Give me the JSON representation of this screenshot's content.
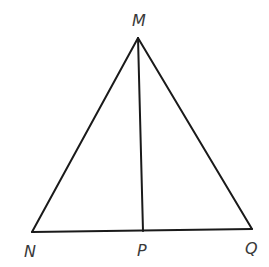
{
  "figure": {
    "type": "triangle with segment",
    "points": {
      "M": {
        "label": "M",
        "x": 138,
        "y": 38
      },
      "N": {
        "label": "N",
        "x": 32,
        "y": 232
      },
      "P": {
        "label": "P",
        "x": 143,
        "y": 231
      },
      "Q": {
        "label": "Q",
        "x": 252,
        "y": 229
      }
    },
    "segments": [
      "MN",
      "MQ",
      "NQ",
      "MP"
    ],
    "labels": {
      "M": "M",
      "N": "N",
      "P": "P",
      "Q": "Q"
    },
    "colors": {
      "line": "#1a1a1a",
      "label": "#3a3a3a",
      "background": "#ffffff"
    }
  }
}
